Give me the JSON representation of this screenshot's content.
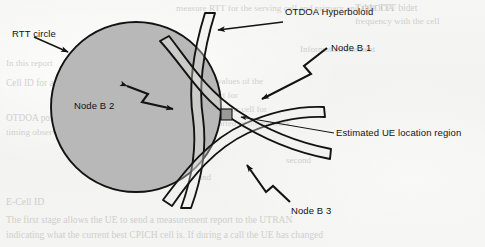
{
  "figure": {
    "kind": "scanned-technical-diagram",
    "background_color": "#f4f4f2",
    "ink_color": "#131313",
    "circle_fill_color": "#b8b8b8",
    "ue_region_color": "#9a9a9a"
  },
  "labels": {
    "rtt_circle": "RTT circle",
    "otdoa_hyperboloid": "OTDOA Hyperboloid",
    "node_b_1": "Node B 1",
    "node_b_2": "Node B 2",
    "node_b_3": "Node B 3",
    "estimated_region": "Estimated UE location region"
  },
  "ghost_text": {
    "lines": [
      {
        "text": "measure RTT for the serving cell and primary and OTDOA",
        "x": 176,
        "y": 3,
        "size": 9.2
      },
      {
        "text": "Table TTT bidet",
        "x": 355,
        "y": 2,
        "size": 9.6
      },
      {
        "text": "frequency with the cell",
        "x": 355,
        "y": 16,
        "size": 9.2
      },
      {
        "text": "the and the",
        "x": 152,
        "y": 44,
        "size": 9.0
      },
      {
        "text": "Information Element",
        "x": 300,
        "y": 44,
        "size": 9.0
      },
      {
        "text": "In this report",
        "x": 6,
        "y": 58,
        "size": 9.0
      },
      {
        "text": "Cell ID for a local UE",
        "x": 6,
        "y": 78,
        "size": 9.4
      },
      {
        "text": "as the report are the timing values of the",
        "x": 118,
        "y": 76,
        "size": 9.0
      },
      {
        "text": "the serving cell and the report for",
        "x": 118,
        "y": 90,
        "size": 9.0
      },
      {
        "text": "SFN-SFN type and the neighbour cell for",
        "x": 118,
        "y": 104,
        "size": 9.0
      },
      {
        "text": "OTDOA positioning",
        "x": 6,
        "y": 113,
        "size": 9.4
      },
      {
        "text": "timing observed by the",
        "x": 6,
        "y": 127,
        "size": 9.2
      },
      {
        "text": "measured at the UE and reported to the network",
        "x": 118,
        "y": 118,
        "size": 9.0
      },
      {
        "text": "second",
        "x": 286,
        "y": 155,
        "size": 9.0
      },
      {
        "text": "and",
        "x": 198,
        "y": 172,
        "size": 9.0
      },
      {
        "text": "E-Cell ID",
        "x": 6,
        "y": 196,
        "size": 9.8
      },
      {
        "text": "The first stage allows the UE to send a measurement report to the UTRAN",
        "x": 6,
        "y": 214,
        "size": 9.6
      },
      {
        "text": "indicating what the current best CPICH cell is. If during a call the UE has changed",
        "x": 6,
        "y": 229,
        "size": 9.6
      }
    ]
  },
  "geometry": {
    "rtt_circle": {
      "cx": 136,
      "cy": 107,
      "r": 85,
      "stroke_width": 1.9
    },
    "ue_region": {
      "x": 221,
      "y": 109,
      "w": 11,
      "h": 11
    },
    "hyperboloid_bands": 3,
    "node_arrows": 3
  },
  "chart_data": {
    "type": "diagram",
    "elements": [
      {
        "name": "RTT circle",
        "role": "Round-trip-time range circle around serving Node B",
        "shape": "filled circle"
      },
      {
        "name": "OTDOA Hyperboloid",
        "role": "Time-difference-of-arrival hyperbolic band (Node B 1)",
        "shape": "curved band"
      },
      {
        "name": "Node B 2",
        "role": "Time-difference-of-arrival hyperbolic band",
        "shape": "curved band"
      },
      {
        "name": "Node B 3",
        "role": "Time-difference-of-arrival hyperbolic band",
        "shape": "curved band"
      },
      {
        "name": "Estimated UE location region",
        "role": "Common intersection of the RTT circle and the three hyperbolic bands",
        "shape": "small square"
      }
    ]
  }
}
